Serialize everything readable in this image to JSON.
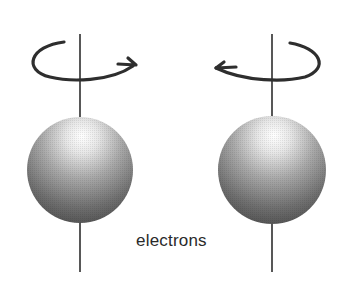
{
  "diagram": {
    "label": "electrons",
    "colors": {
      "stroke": "#2e2e2e",
      "sphere_highlight": "#ffffff",
      "sphere_mid": "#9a9a9a",
      "sphere_dark": "#4a4a4a"
    },
    "electrons": [
      {
        "id": "left",
        "spin_direction": "counterclockwise-arrow-right",
        "icon": "rotation-arrow-icon"
      },
      {
        "id": "right",
        "spin_direction": "clockwise-arrow-left",
        "icon": "rotation-arrow-icon"
      }
    ]
  }
}
